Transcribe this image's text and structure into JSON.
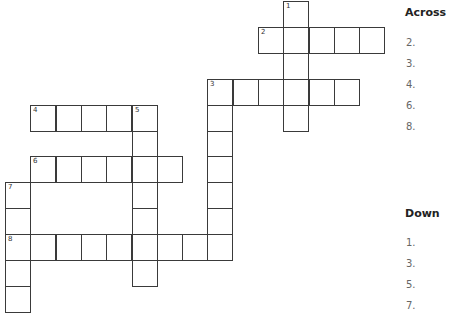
{
  "puzzle": {
    "cell_size": 25.3,
    "origin": {
      "x": 5,
      "y": 1
    },
    "row_height": 25.9,
    "entries": [
      {
        "number": "1",
        "direction": "down",
        "row": 0,
        "col": 11,
        "length": 5
      },
      {
        "number": "2",
        "direction": "across",
        "row": 1,
        "col": 10,
        "length": 5
      },
      {
        "number": "3",
        "direction": "across",
        "row": 3,
        "col": 8,
        "length": 6
      },
      {
        "number": "3",
        "direction": "down",
        "row": 3,
        "col": 8,
        "length": 7
      },
      {
        "number": "4",
        "direction": "across",
        "row": 4,
        "col": 1,
        "length": 5
      },
      {
        "number": "5",
        "direction": "down",
        "row": 4,
        "col": 5,
        "length": 7
      },
      {
        "number": "6",
        "direction": "across",
        "row": 6,
        "col": 1,
        "length": 6
      },
      {
        "number": "7",
        "direction": "down",
        "row": 7,
        "col": 0,
        "length": 5
      },
      {
        "number": "8",
        "direction": "across",
        "row": 9,
        "col": 0,
        "length": 9
      }
    ]
  },
  "clues": {
    "across": {
      "heading": "Across",
      "items": [
        {
          "number": "2.",
          "text": ""
        },
        {
          "number": "3.",
          "text": ""
        },
        {
          "number": "4.",
          "text": ""
        },
        {
          "number": "6.",
          "text": ""
        },
        {
          "number": "8.",
          "text": ""
        }
      ]
    },
    "down": {
      "heading": "Down",
      "items": [
        {
          "number": "1.",
          "text": ""
        },
        {
          "number": "3.",
          "text": ""
        },
        {
          "number": "5.",
          "text": ""
        },
        {
          "number": "7.",
          "text": ""
        }
      ]
    }
  }
}
